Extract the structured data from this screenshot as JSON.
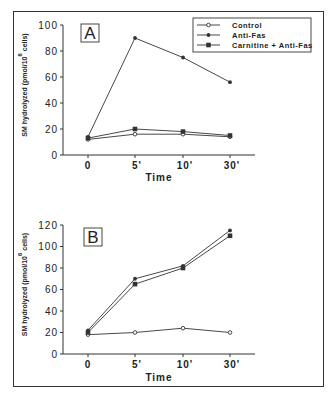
{
  "chart_data": [
    {
      "type": "line",
      "panel": "A",
      "title": "",
      "xlabel": "Time",
      "ylabel": "SM hydrolyzed (pmol/10^6 cells)",
      "ylabel_main": "SM hydrolyzed (pmol/10",
      "ylabel_sup": "6",
      "ylabel_end": " cells)",
      "categories": [
        "0",
        "5'",
        "10'",
        "30'"
      ],
      "ylim": [
        0,
        100
      ],
      "yticks": [
        0,
        20,
        40,
        60,
        80,
        100
      ],
      "grid": false,
      "legend_position": "upper right",
      "series": [
        {
          "name": "Control",
          "marker": "open-circle",
          "values": [
            12,
            16,
            16,
            14
          ]
        },
        {
          "name": "Anti-Fas",
          "marker": "filled-circle",
          "values": [
            14,
            90,
            75,
            56
          ]
        },
        {
          "name": "Carnitine + Anti-Fas",
          "marker": "filled-square",
          "values": [
            13,
            20,
            18,
            15
          ]
        }
      ]
    },
    {
      "type": "line",
      "panel": "B",
      "title": "",
      "xlabel": "Time",
      "ylabel": "SM hydrolyzed (pmol/10^6 cells)",
      "ylabel_main": "SM hydrolyzed (pmol/10",
      "ylabel_sup": "6",
      "ylabel_end": " cells)",
      "categories": [
        "0",
        "5'",
        "10'",
        "30'"
      ],
      "ylim": [
        0,
        120
      ],
      "yticks": [
        0,
        20,
        40,
        60,
        80,
        100,
        120
      ],
      "grid": false,
      "series": [
        {
          "name": "Control",
          "marker": "open-circle",
          "values": [
            18,
            20,
            24,
            20
          ]
        },
        {
          "name": "Anti-Fas",
          "marker": "filled-circle",
          "values": [
            22,
            70,
            82,
            115
          ]
        },
        {
          "name": "Carnitine + Anti-Fas",
          "marker": "filled-square",
          "values": [
            20,
            65,
            80,
            110
          ]
        }
      ]
    }
  ],
  "legend": {
    "items": [
      {
        "label": "Control",
        "marker": "open-circle"
      },
      {
        "label": "Anti-Fas",
        "marker": "filled-circle"
      },
      {
        "label": "Carnitine  +  Anti-Fas",
        "marker": "filled-square"
      }
    ]
  },
  "colors": {
    "line": "#333333",
    "text": "#222222",
    "background": "#ffffff"
  }
}
